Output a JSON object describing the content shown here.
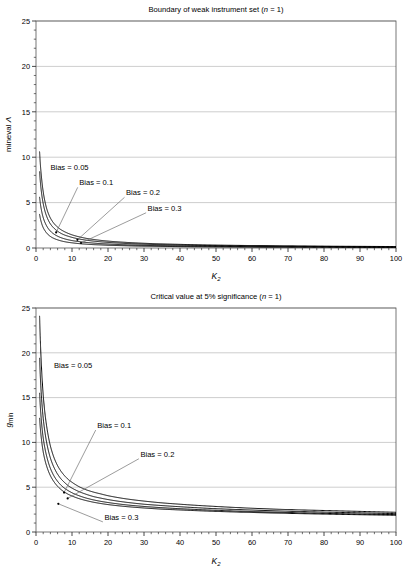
{
  "figure": {
    "panels": [
      {
        "id": "weak-instrument-boundary",
        "title_main": "Boundary of weak instrument set (",
        "title_italic": "n",
        "title_tail": " = 1)",
        "title_full": "Boundary of weak instrument set (n = 1)",
        "ylabel_text": "mineval ",
        "ylabel_symbol": "Λ",
        "ylabel_full": "mineval Λ",
        "xlabel_italic": "K",
        "xlabel_sub": "2",
        "xlabel_full": "K2",
        "annotations": [
          {
            "label": "Bias = 0.05"
          },
          {
            "label": "Bias = 0.1"
          },
          {
            "label": "Bias = 0.2"
          },
          {
            "label": "Bias = 0.3"
          }
        ]
      },
      {
        "id": "critical-value-5pct",
        "title_main": "Critical value at 5% significance (",
        "title_italic": "n",
        "title_tail": " = 1)",
        "title_full": "Critical value at 5% significance (n = 1)",
        "ylabel_text": "",
        "ylabel_symbol": "g",
        "ylabel_sub": "min",
        "ylabel_full": "gmin",
        "xlabel_italic": "K",
        "xlabel_sub": "2",
        "xlabel_full": "K2",
        "annotations": [
          {
            "label": "Bias = 0.05"
          },
          {
            "label": "Bias = 0.1"
          },
          {
            "label": "Bias = 0.2"
          },
          {
            "label": "Bias = 0.3"
          }
        ]
      }
    ]
  },
  "chart_data": [
    {
      "type": "line",
      "title": "Boundary of weak instrument set (n = 1)",
      "xlabel": "K2",
      "ylabel": "mineval Λ",
      "xlim": [
        0,
        100
      ],
      "ylim": [
        0,
        25
      ],
      "xticks": [
        0,
        10,
        20,
        30,
        40,
        50,
        60,
        70,
        80,
        90,
        100
      ],
      "yticks": [
        0,
        5,
        10,
        15,
        20,
        25
      ],
      "xminor_step": 2,
      "yminor_step": 1,
      "grid": "horizontal",
      "legend": "annotations",
      "line_color": "#000000",
      "x": [
        1,
        1.5,
        2,
        2.5,
        3,
        4,
        5,
        6,
        7,
        8,
        9,
        10,
        12,
        14,
        16,
        18,
        20,
        25,
        30,
        35,
        40,
        50,
        60,
        70,
        80,
        90,
        100
      ],
      "series": [
        {
          "name": "Bias = 0.05",
          "values": [
            10.6,
            7.9,
            6.2,
            5.1,
            4.3,
            3.3,
            2.7,
            2.3,
            2.0,
            1.78,
            1.6,
            1.45,
            1.23,
            1.06,
            0.94,
            0.84,
            0.76,
            0.62,
            0.52,
            0.45,
            0.4,
            0.32,
            0.27,
            0.23,
            0.2,
            0.18,
            0.16
          ]
        },
        {
          "name": "Bias = 0.1",
          "values": [
            8.4,
            6.2,
            4.9,
            4.05,
            3.45,
            2.65,
            2.18,
            1.85,
            1.6,
            1.42,
            1.29,
            1.17,
            0.99,
            0.86,
            0.76,
            0.68,
            0.62,
            0.5,
            0.42,
            0.36,
            0.32,
            0.26,
            0.22,
            0.19,
            0.17,
            0.15,
            0.13
          ]
        },
        {
          "name": "Bias = 0.2",
          "values": [
            5.6,
            4.2,
            3.35,
            2.8,
            2.4,
            1.86,
            1.53,
            1.3,
            1.13,
            1.0,
            0.9,
            0.82,
            0.7,
            0.61,
            0.54,
            0.48,
            0.44,
            0.35,
            0.29,
            0.25,
            0.22,
            0.18,
            0.15,
            0.13,
            0.12,
            0.1,
            0.09
          ]
        },
        {
          "name": "Bias = 0.3",
          "values": [
            3.7,
            2.8,
            2.25,
            1.9,
            1.63,
            1.27,
            1.05,
            0.9,
            0.78,
            0.69,
            0.62,
            0.57,
            0.48,
            0.42,
            0.37,
            0.34,
            0.3,
            0.25,
            0.2,
            0.18,
            0.15,
            0.12,
            0.1,
            0.09,
            0.08,
            0.07,
            0.065
          ]
        }
      ],
      "annotation_points": [
        {
          "label": "Bias = 0.05",
          "text_x": 4,
          "text_y": 8.6,
          "leader": false
        },
        {
          "label": "Bias = 0.1",
          "text_x": 12,
          "text_y": 6.9,
          "anchor_x": 5.6,
          "anchor_y": 1.72,
          "leader": true
        },
        {
          "label": "Bias = 0.2",
          "text_x": 25,
          "text_y": 5.8,
          "anchor_x": 11.5,
          "anchor_y": 0.9,
          "leader": true
        },
        {
          "label": "Bias = 0.3",
          "text_x": 31,
          "text_y": 4.1,
          "anchor_x": 12.5,
          "anchor_y": 0.55,
          "leader": true
        }
      ]
    },
    {
      "type": "line",
      "title": "Critical value at 5% significance (n = 1)",
      "xlabel": "K2",
      "ylabel": "gmin",
      "xlim": [
        0,
        100
      ],
      "ylim": [
        0,
        25
      ],
      "xticks": [
        0,
        10,
        20,
        30,
        40,
        50,
        60,
        70,
        80,
        90,
        100
      ],
      "yticks": [
        0,
        5,
        10,
        15,
        20,
        25
      ],
      "xminor_step": 2,
      "yminor_step": 1,
      "grid": "horizontal",
      "legend": "annotations",
      "line_color": "#000000",
      "x": [
        1,
        1.5,
        2,
        2.5,
        3,
        4,
        5,
        6,
        7,
        8,
        9,
        10,
        12,
        14,
        16,
        18,
        20,
        25,
        30,
        35,
        40,
        50,
        60,
        70,
        80,
        90,
        100
      ],
      "series": [
        {
          "name": "Bias = 0.05",
          "values": [
            24.1,
            18.6,
            15.3,
            13.2,
            11.7,
            9.6,
            8.3,
            7.4,
            6.75,
            6.25,
            5.85,
            5.55,
            5.05,
            4.7,
            4.45,
            4.25,
            4.05,
            3.7,
            3.45,
            3.25,
            3.1,
            2.85,
            2.65,
            2.5,
            2.4,
            2.3,
            2.2
          ]
        },
        {
          "name": "Bias = 0.1",
          "values": [
            19.4,
            15.2,
            12.7,
            11.1,
            9.9,
            8.25,
            7.2,
            6.45,
            5.9,
            5.5,
            5.15,
            4.9,
            4.5,
            4.2,
            3.95,
            3.78,
            3.62,
            3.32,
            3.1,
            2.95,
            2.82,
            2.6,
            2.45,
            2.32,
            2.22,
            2.14,
            2.05
          ]
        },
        {
          "name": "Bias = 0.2",
          "values": [
            15.5,
            12.4,
            10.5,
            9.3,
            8.4,
            7.1,
            6.25,
            5.65,
            5.2,
            4.86,
            4.6,
            4.38,
            4.04,
            3.78,
            3.58,
            3.42,
            3.29,
            3.03,
            2.85,
            2.71,
            2.6,
            2.42,
            2.28,
            2.17,
            2.08,
            2.0,
            1.94
          ]
        },
        {
          "name": "Bias = 0.3",
          "values": [
            12.7,
            10.4,
            8.95,
            8.0,
            7.3,
            6.28,
            5.6,
            5.1,
            4.72,
            4.43,
            4.2,
            4.02,
            3.72,
            3.5,
            3.32,
            3.18,
            3.06,
            2.84,
            2.68,
            2.55,
            2.46,
            2.3,
            2.18,
            2.08,
            2.0,
            1.93,
            1.87
          ]
        }
      ],
      "annotation_points": [
        {
          "label": "Bias = 0.05",
          "text_x": 5,
          "text_y": 18.3,
          "leader": false
        },
        {
          "label": "Bias = 0.1",
          "text_x": 17,
          "text_y": 11.6,
          "anchor_x": 7.8,
          "anchor_y": 4.4,
          "leader": true
        },
        {
          "label": "Bias = 0.2",
          "text_x": 29,
          "text_y": 8.4,
          "anchor_x": 8.8,
          "anchor_y": 3.75,
          "leader": true
        },
        {
          "label": "Bias = 0.3",
          "text_x": 19,
          "text_y": 1.35,
          "anchor_x": 6.2,
          "anchor_y": 3.15,
          "leader": true
        }
      ]
    }
  ]
}
